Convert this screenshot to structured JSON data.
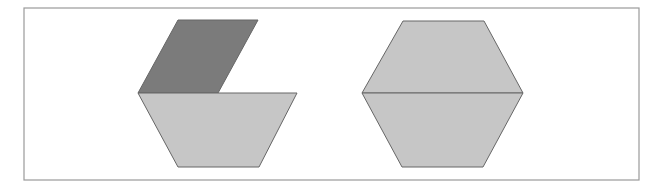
{
  "diagram": {
    "colors": {
      "background": "#ffffff",
      "frame_stroke": "#9a9a9a",
      "dark_fill": "#7b7b7b",
      "light_fill": "#c6c6c6",
      "shape_stroke": "#666666"
    },
    "frame": {
      "x": 24,
      "y": 8,
      "width": 615,
      "height": 172
    },
    "figures": [
      {
        "name": "left-composition",
        "shapes": [
          {
            "type": "parallelogram",
            "fill": "dark",
            "points": "178,20 258,20 218,93 138,93"
          },
          {
            "type": "trapezoid",
            "fill": "light",
            "points": "138,93 297,93 259,167 178,167"
          }
        ]
      },
      {
        "name": "right-hexagon",
        "shapes": [
          {
            "type": "trapezoid",
            "fill": "light",
            "points": "403,21 484,21 523,93 362,93"
          },
          {
            "type": "trapezoid",
            "fill": "light",
            "points": "362,93 523,93 483,167 402,167"
          }
        ]
      }
    ]
  }
}
